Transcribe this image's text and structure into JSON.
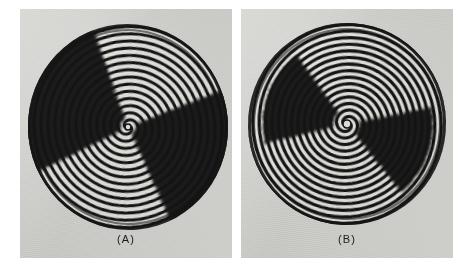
{
  "figure": {
    "kind": "photographic-figure",
    "background_color": "#ffffff",
    "panel_background_color": "#e3e3e1",
    "fringe_dark_color": "#161616",
    "fringe_light_color": "#f2f2ef"
  },
  "panels": [
    {
      "id": "panel-a",
      "caption": "(A)",
      "x": 20,
      "y": 9,
      "width": 212,
      "height": 249,
      "disc": {
        "center_x": 108,
        "center_y": 118,
        "radius_x": 100,
        "radius_y": 103,
        "rotation_deg": -6
      },
      "pattern": {
        "type": "archimedean-spiral-fringes",
        "arms": 2,
        "turn_count": 13,
        "spiral_pitch_px": 7.2,
        "stroke_width_px": 3.0,
        "inner_hole_radius_px": 3,
        "handedness": "counter-clockwise"
      },
      "dark_sectors": [
        {
          "name": "upper-left-blob",
          "center_angle_deg": 208,
          "span_deg": 96,
          "inner_r": 8,
          "outer_r": 104
        },
        {
          "name": "lower-right-blob",
          "center_angle_deg": 28,
          "span_deg": 86,
          "inner_r": 8,
          "outer_r": 104
        }
      ]
    },
    {
      "id": "panel-b",
      "caption": "(B)",
      "x": 241,
      "y": 9,
      "width": 212,
      "height": 249,
      "disc": {
        "center_x": 106,
        "center_y": 115,
        "radius_x": 99,
        "radius_y": 101,
        "rotation_deg": 4
      },
      "pattern": {
        "type": "archimedean-spiral-fringes",
        "arms": 2,
        "turn_count": 14,
        "spiral_pitch_px": 6.6,
        "stroke_width_px": 3.2,
        "inner_hole_radius_px": 4,
        "handedness": "counter-clockwise"
      },
      "dark_sectors": [
        {
          "name": "upper-left-blob",
          "center_angle_deg": 196,
          "span_deg": 66,
          "inner_r": 14,
          "outer_r": 86
        },
        {
          "name": "lower-right-blob",
          "center_angle_deg": 16,
          "span_deg": 62,
          "inner_r": 12,
          "outer_r": 88
        }
      ]
    }
  ]
}
